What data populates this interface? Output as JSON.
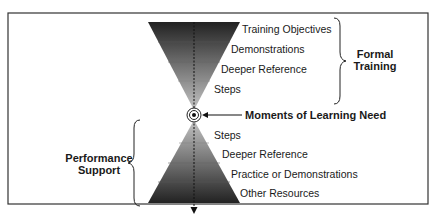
{
  "diagram": {
    "type": "hourglass",
    "center_label": "Moments of Learning Need",
    "top_group": {
      "bracket_label_line1": "Formal",
      "bracket_label_line2": "Training",
      "items": [
        {
          "label": "Training Objectives"
        },
        {
          "label": "Demonstrations"
        },
        {
          "label": "Deeper Reference"
        },
        {
          "label": "Steps"
        }
      ]
    },
    "bottom_group": {
      "bracket_label_line1": "Performance",
      "bracket_label_line2": "Support",
      "items": [
        {
          "label": "Steps"
        },
        {
          "label": "Deeper Reference"
        },
        {
          "label": "Practice or Demonstrations"
        },
        {
          "label": "Other Resources"
        }
      ]
    },
    "colors": {
      "dark": "#2a2a2a",
      "light": "#b8b8b8",
      "frame": "#333333"
    }
  }
}
